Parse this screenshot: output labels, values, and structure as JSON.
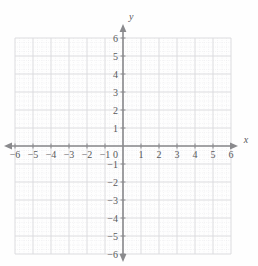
{
  "chart_data": {
    "type": "scatter",
    "title": "",
    "subtitle": "",
    "xlabel": "x",
    "ylabel": "y",
    "xlim": [
      -6,
      6
    ],
    "ylim": [
      -6,
      6
    ],
    "xticks": [
      -6,
      -5,
      -4,
      -3,
      -2,
      -1,
      1,
      2,
      3,
      4,
      5,
      6
    ],
    "yticks": [
      6,
      5,
      4,
      3,
      2,
      1,
      -1,
      -2,
      -3,
      -4,
      -5,
      -6
    ],
    "xtick_labels": [
      "−6",
      "−5",
      "−4",
      "−3",
      "−2",
      "−1",
      "1",
      "2",
      "3",
      "4",
      "5",
      "6"
    ],
    "ytick_labels": [
      "6",
      "5",
      "4",
      "3",
      "2",
      "1",
      "−1",
      "−2",
      "−3",
      "−4",
      "−5",
      "−6"
    ],
    "origin_label": "0",
    "grid": true,
    "grid_minor": true,
    "grid_minor_divisions": 4,
    "legend": null,
    "series": [],
    "annotations": [],
    "axis_arrows": [
      "left",
      "right",
      "up",
      "down"
    ]
  },
  "style": {
    "axis_color": "#8a8a8d",
    "grid_major_color": "#d9d9dd",
    "grid_minor_color": "#e6e6ea",
    "label_color": "#58585a",
    "background": "#fefefe"
  },
  "geometry": {
    "origin_x": 123,
    "origin_y": 146,
    "unit_px": 18,
    "canvas_width": 258,
    "canvas_height": 266
  }
}
